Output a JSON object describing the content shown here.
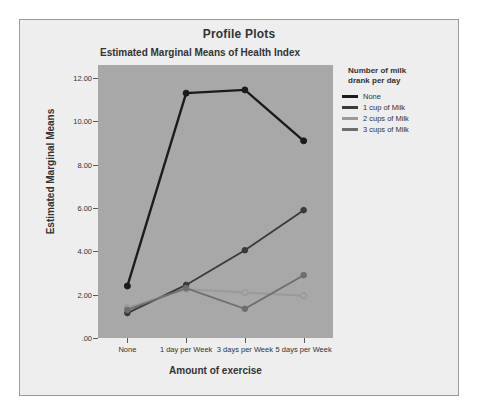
{
  "window": {
    "background_color": "#eeeeee",
    "border_color": "#9a9a9a"
  },
  "header": {
    "title": "Profile Plots"
  },
  "chart_data": {
    "type": "line",
    "title": "Estimated Marginal Means of Health Index",
    "xlabel": "Amount of exercise",
    "ylabel": "Estimated Marginal Means",
    "categories": [
      "None",
      "1 day per Week",
      "3 days per Week",
      "5 days per Week"
    ],
    "ylim": [
      0,
      12.6
    ],
    "ytick_labels": [
      ".00",
      "2.00",
      "4.00",
      "6.00",
      "8.00",
      "10.00",
      "12.00"
    ],
    "ytick_values": [
      0,
      2,
      4,
      6,
      8,
      10,
      12
    ],
    "grid": false,
    "plot_background": "#a8a8a8",
    "legend_position": "right",
    "legend_title": "Number of milk\ndrank per day",
    "legend_title_line1": "Number of milk",
    "legend_title_line2": "drank per day",
    "series": [
      {
        "name": "None",
        "color": "#1b1b1b",
        "marker": "filled-circle",
        "values": [
          2.4,
          11.3,
          11.45,
          9.1
        ]
      },
      {
        "name": "1 cup of Milk",
        "color": "#3a3a3a",
        "marker": "filled-circle",
        "values": [
          1.15,
          2.45,
          4.05,
          5.9
        ]
      },
      {
        "name": "2 cups of Milk",
        "color": "#9a9a9a",
        "marker": "open-circle",
        "values": [
          1.4,
          2.25,
          2.1,
          1.95
        ]
      },
      {
        "name": "3 cups of Milk",
        "color": "#6e6e6e",
        "marker": "filled-circle",
        "values": [
          1.3,
          2.3,
          1.35,
          2.9
        ]
      }
    ]
  }
}
